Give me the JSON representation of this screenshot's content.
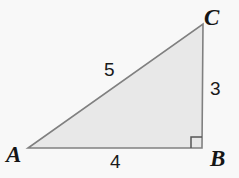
{
  "figure": {
    "kind": "right-triangle-diagram",
    "background_color": "#f8f8f8",
    "fill_color": "#e8e8e8",
    "stroke_color": "#808080",
    "label_color": "#151515",
    "width": 239,
    "height": 178,
    "vertices": [
      {
        "name": "A",
        "label": "A",
        "x": 28,
        "y": 148
      },
      {
        "name": "B",
        "label": "B",
        "x": 202,
        "y": 148
      },
      {
        "name": "C",
        "label": "C",
        "x": 203,
        "y": 24
      }
    ],
    "sides": [
      {
        "name": "hypotenuse-AC",
        "label": "5",
        "from": "A",
        "to": "C"
      },
      {
        "name": "leg-BC",
        "label": "3",
        "from": "B",
        "to": "C"
      },
      {
        "name": "leg-AB",
        "label": "4",
        "from": "A",
        "to": "B"
      }
    ],
    "right_angle": {
      "at": "B",
      "marker": "square",
      "size": 11
    }
  }
}
